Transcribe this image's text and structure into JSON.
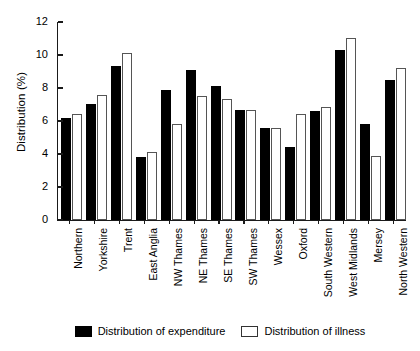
{
  "chart_data": {
    "type": "bar",
    "title": "",
    "xlabel": "",
    "ylabel": "Distribution (%)",
    "ylim": [
      0,
      12
    ],
    "yticks": [
      0,
      2,
      4,
      6,
      8,
      10,
      12
    ],
    "ytick_labels": [
      "0",
      "2",
      "4",
      "6",
      "8",
      "10",
      "12"
    ],
    "grid": false,
    "legend_position": "bottom",
    "categories": [
      "Northern",
      "Yorkshire",
      "Trent",
      "East Anglia",
      "NW Thames",
      "NE Thames",
      "SE Thames",
      "SW Thames",
      "Wessex",
      "Oxford",
      "South Western",
      "West Midlands",
      "Mersey",
      "North Western"
    ],
    "series": [
      {
        "name": "Distribution of expenditure",
        "color": "#000000",
        "style": "filled",
        "values": [
          6.2,
          7.05,
          9.35,
          3.8,
          7.9,
          9.1,
          8.15,
          6.65,
          5.6,
          4.4,
          6.6,
          10.3,
          5.8,
          8.5
        ]
      },
      {
        "name": "Distribution of illness",
        "color": "#ffffff",
        "style": "outlined",
        "values": [
          6.45,
          7.55,
          10.1,
          4.1,
          5.8,
          7.5,
          7.35,
          6.65,
          5.6,
          6.45,
          6.85,
          11.05,
          3.9,
          9.2
        ]
      }
    ]
  },
  "legend": {
    "items": [
      {
        "label": "Distribution of expenditure",
        "swatch": "filled-black-swatch"
      },
      {
        "label": "Distribution of illness",
        "swatch": "outlined-white-swatch"
      }
    ]
  }
}
